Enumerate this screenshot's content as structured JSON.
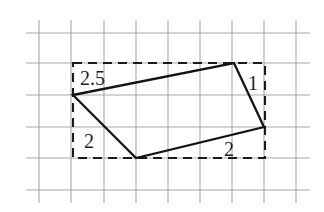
{
  "figure": {
    "background_color": "#ffffff",
    "grid_color": "#9a9a9a",
    "shape_color": "#141414",
    "bbox_color": "#1a1a1a"
  },
  "grid": {
    "cell_size": 32,
    "vertical_lines_x": [
      39,
      71,
      104,
      136,
      168,
      200,
      232,
      264,
      296
    ],
    "horizontal_lines_y": [
      33,
      63,
      95,
      127,
      158,
      190
    ],
    "x_start": 26,
    "x_end": 310,
    "y_start": 20,
    "y_end": 203
  },
  "bounding_box": {
    "style": "dashed",
    "left": 73,
    "top": 63,
    "right": 265,
    "bottom": 158,
    "width_cells": 6,
    "height_cells": 3
  },
  "shape": {
    "type": "quadrilateral",
    "vertices": [
      {
        "name": "left",
        "x": 73,
        "y": 95
      },
      {
        "name": "top-right",
        "x": 234,
        "y": 63
      },
      {
        "name": "right",
        "x": 264,
        "y": 127
      },
      {
        "name": "bottom",
        "x": 136,
        "y": 158
      }
    ],
    "points_attr": "73,95 234,63 264,127 136,158"
  },
  "labels": [
    {
      "id": "label-top-left",
      "text": "2.5",
      "x": 80,
      "y": 85,
      "edge": "left-to-top-right"
    },
    {
      "id": "label-right",
      "text": "1",
      "x": 248,
      "y": 90,
      "edge": "top-right-to-right"
    },
    {
      "id": "label-bottom-left",
      "text": "2",
      "x": 84,
      "y": 148,
      "edge": "left-to-bottom"
    },
    {
      "id": "label-bottom-right",
      "text": "2",
      "x": 224,
      "y": 156,
      "edge": "bottom-to-right"
    }
  ]
}
